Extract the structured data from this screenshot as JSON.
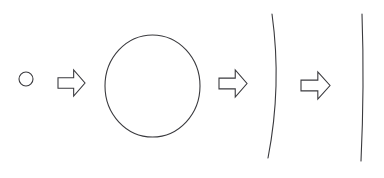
{
  "canvas": {
    "width": 384,
    "height": 178,
    "background_color": "#ffffff",
    "stroke_color": "#3a3a3e"
  },
  "diagram": {
    "type": "progression",
    "steps": [
      {
        "index": 0,
        "kind": "circle",
        "name": "small-circle",
        "cx": 26,
        "cy": 79,
        "r": 7,
        "stroke_width": 1.1
      },
      {
        "index": 1,
        "kind": "arrow",
        "name": "arrow-one",
        "x": 58,
        "y": 70,
        "width": 27,
        "height": 26,
        "direction": "right",
        "stroke_width": 1.1
      },
      {
        "index": 2,
        "kind": "circle",
        "name": "large-circle",
        "cx": 152.5,
        "cy": 86,
        "rx": 47.5,
        "ry": 51,
        "stroke_width": 1.1
      },
      {
        "index": 3,
        "kind": "arrow",
        "name": "arrow-two",
        "x": 219,
        "y": 70,
        "width": 28,
        "height": 27,
        "direction": "right",
        "stroke_width": 1.1
      },
      {
        "index": 4,
        "kind": "curve",
        "name": "curved-line",
        "x_top": 272,
        "y_top": 14,
        "x_mid": 276,
        "y_mid": 86,
        "x_bottom": 268,
        "y_bottom": 158,
        "stroke_width": 1.1
      },
      {
        "index": 5,
        "kind": "arrow",
        "name": "arrow-three",
        "x": 301,
        "y": 72,
        "width": 29,
        "height": 27,
        "direction": "right",
        "stroke_width": 1.1
      },
      {
        "index": 6,
        "kind": "curve",
        "name": "straight-line",
        "x_top": 362,
        "y_top": 14,
        "x_mid": 363,
        "y_mid": 86,
        "x_bottom": 361,
        "y_bottom": 161,
        "stroke_width": 1.1
      }
    ]
  }
}
